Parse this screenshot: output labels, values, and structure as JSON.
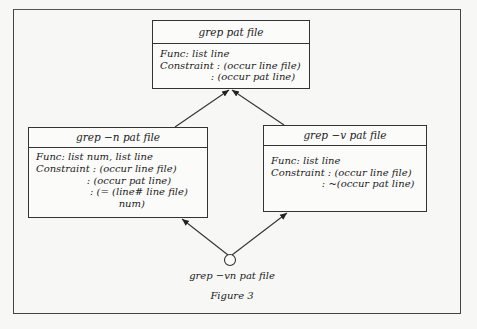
{
  "figure": {
    "caption": "Figure 3",
    "bottom_node_label": "grep −vn pat file"
  },
  "nodes": {
    "top": {
      "title": "grep pat file",
      "lines": [
        "Func: list line",
        "Constraint : (occur line file)",
        "                : (occur pat line)"
      ]
    },
    "left": {
      "title": "grep −n pat file",
      "lines": [
        "Func: list num, list line",
        "Constraint : (occur line file)",
        "                : (occur pat line)",
        "                 : (= (line# line file)",
        "                          num)"
      ]
    },
    "right": {
      "title": "grep −v pat file",
      "lines": [
        "Func: list line",
        "Constraint : (occur line file)",
        "                : ~(occur pat line)"
      ]
    }
  },
  "edges": [
    {
      "from": "left",
      "to": "top"
    },
    {
      "from": "right",
      "to": "top"
    },
    {
      "from": "bottom",
      "to": "left"
    },
    {
      "from": "bottom",
      "to": "right"
    }
  ],
  "colors": {
    "ink": "#222222",
    "paper": "#f7f7f5"
  }
}
